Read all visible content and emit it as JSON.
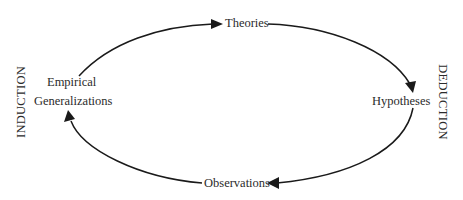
{
  "diagram": {
    "type": "cycle",
    "nodes": {
      "theories": "Theories",
      "hypotheses": "Hypotheses",
      "observations": "Observations",
      "empirical_line1": "Empirical",
      "empirical_line2": "Generalizations"
    },
    "side_labels": {
      "left": "INDUCTION",
      "right": "DEDUCTION"
    },
    "edges": [
      {
        "from": "Empirical Generalizations",
        "to": "Theories"
      },
      {
        "from": "Theories",
        "to": "Hypotheses"
      },
      {
        "from": "Hypotheses",
        "to": "Observations"
      },
      {
        "from": "Observations",
        "to": "Empirical Generalizations"
      }
    ],
    "colors": {
      "line": "#1a1a1a",
      "text": "#2b2b2b",
      "background": "#ffffff"
    }
  }
}
